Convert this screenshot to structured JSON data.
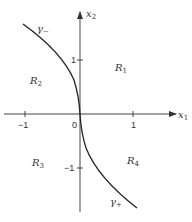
{
  "diagram": {
    "axes": {
      "x_label": "x",
      "x_label_sub": "1",
      "y_label": "x",
      "y_label_sub": "2",
      "origin_label": "0",
      "x_ticks": [
        "−1",
        "1"
      ],
      "y_ticks": [
        "1",
        "−1"
      ]
    },
    "regions": [
      {
        "name": "R",
        "sub": "1"
      },
      {
        "name": "R",
        "sub": "2"
      },
      {
        "name": "R",
        "sub": "3"
      },
      {
        "name": "R",
        "sub": "4"
      }
    ],
    "curves": [
      {
        "name": "γ",
        "sub": "−"
      },
      {
        "name": "γ",
        "sub": "+"
      }
    ]
  }
}
